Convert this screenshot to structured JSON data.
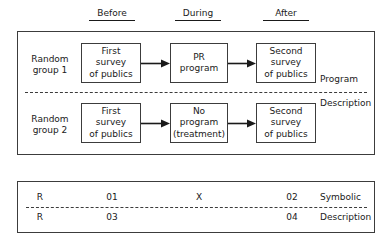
{
  "diagram": {
    "column_headers": [
      {
        "id": "before",
        "label": "Before"
      },
      {
        "id": "during",
        "label": "During"
      },
      {
        "id": "after",
        "label": "After"
      }
    ],
    "design_panel": {
      "rows": [
        {
          "group_label": "Random\ngroup 1",
          "group_label_line1": "Random",
          "group_label_line2": "group 1",
          "cells": [
            {
              "line1": "First",
              "line2": "survey",
              "line3": "of publics"
            },
            {
              "line1": "PR",
              "line2": "program",
              "line3": ""
            },
            {
              "line1": "Second",
              "line2": "survey",
              "line3": "of publics"
            }
          ]
        },
        {
          "group_label_line1": "Random",
          "group_label_line2": "group 2",
          "cells": [
            {
              "line1": "First",
              "line2": "survey",
              "line3": "of publics"
            },
            {
              "line1": "No",
              "line2": "program",
              "line3": "(treatment)"
            },
            {
              "line1": "Second",
              "line2": "survey",
              "line3": "of publics"
            }
          ]
        }
      ],
      "side_caption_top": "Program",
      "side_caption_bottom": "Description"
    },
    "symbolic_panel": {
      "rows": [
        {
          "r": "R",
          "o_before": "01",
          "x": "X",
          "o_after": "02",
          "caption": "Symbolic"
        },
        {
          "r": "R",
          "o_before": "03",
          "x": "",
          "o_after": "04",
          "caption": "Description"
        }
      ]
    },
    "colors": {
      "ink": "#1a1a1a",
      "rule": "#3c3c3c",
      "background": "#ffffff"
    }
  }
}
